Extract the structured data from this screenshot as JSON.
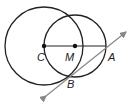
{
  "diagram": {
    "labels": {
      "C": "C",
      "M": "M",
      "A": "A",
      "B": "B"
    },
    "circle_c": {
      "cx": 44,
      "cy": 46,
      "r": 39
    },
    "circle_m": {
      "cx": 75,
      "cy": 46,
      "r": 31
    },
    "points": {
      "C": [
        44,
        46
      ],
      "M": [
        75,
        46
      ],
      "A": [
        106,
        46
      ],
      "B": [
        70,
        76
      ]
    },
    "tangent_line": {
      "from": [
        43,
        98
      ],
      "to": [
        128,
        30
      ],
      "color": "#888888"
    }
  }
}
